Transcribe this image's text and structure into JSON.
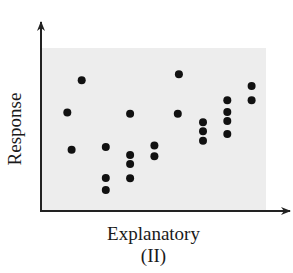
{
  "chart_data": {
    "type": "scatter",
    "title": "",
    "panel_label": "(II)",
    "xlabel": "Explanatory",
    "ylabel": "Response",
    "xlim": [
      0,
      100
    ],
    "ylim": [
      0,
      100
    ],
    "grid": false,
    "legend": null,
    "axis_ticks": "none",
    "colors": {
      "background": "#ededed",
      "points": "#111111",
      "axes": "#222222"
    },
    "points": [
      {
        "x": 11.7,
        "y": 60.5
      },
      {
        "x": 13.6,
        "y": 37.6
      },
      {
        "x": 18.1,
        "y": 80.2
      },
      {
        "x": 28.8,
        "y": 39.3
      },
      {
        "x": 28.8,
        "y": 20.2
      },
      {
        "x": 28.8,
        "y": 12.9
      },
      {
        "x": 39.6,
        "y": 59.7
      },
      {
        "x": 39.6,
        "y": 34.4
      },
      {
        "x": 39.6,
        "y": 28.8
      },
      {
        "x": 39.6,
        "y": 20.1
      },
      {
        "x": 50.4,
        "y": 40.1
      },
      {
        "x": 50.4,
        "y": 33.6
      },
      {
        "x": 61.3,
        "y": 83.9
      },
      {
        "x": 60.8,
        "y": 59.7
      },
      {
        "x": 72.0,
        "y": 54.4
      },
      {
        "x": 72.0,
        "y": 48.9
      },
      {
        "x": 72.0,
        "y": 43.1
      },
      {
        "x": 82.8,
        "y": 67.9
      },
      {
        "x": 82.8,
        "y": 60.7
      },
      {
        "x": 82.8,
        "y": 55.2
      },
      {
        "x": 82.8,
        "y": 47.2
      },
      {
        "x": 93.6,
        "y": 76.7
      },
      {
        "x": 93.6,
        "y": 67.9
      }
    ]
  }
}
